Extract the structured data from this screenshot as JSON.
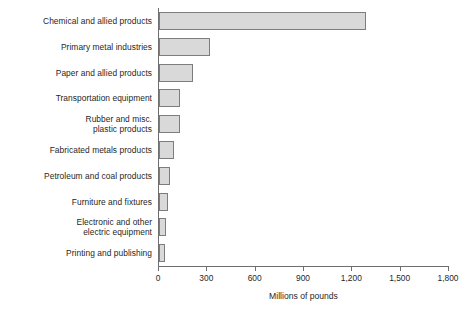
{
  "chart_data": {
    "type": "bar",
    "orientation": "horizontal",
    "title": "",
    "xlabel": "Millions of pounds",
    "ylabel": "",
    "xlim": [
      0,
      1800
    ],
    "xticks": [
      0,
      300,
      600,
      900,
      1200,
      1500,
      1800
    ],
    "xtick_labels": [
      "0",
      "300",
      "600",
      "900",
      "1,200",
      "1,500",
      "1,800"
    ],
    "grid": false,
    "legend": null,
    "bar_fill_color": "#d9d9d9",
    "bar_edge_color": "#7d7d7d",
    "axis_color": "#6e6e6e",
    "categories": [
      "Chemical and allied products",
      "Primary metal industries",
      "Paper and allied products",
      "Transportation equipment",
      "Rubber and misc. plastic products",
      "Fabricated metals products",
      "Petroleum and coal products",
      "Furniture and fixtures",
      "Electronic and other electric equipment",
      "Printing and publishing"
    ],
    "values": [
      1285,
      317,
      211,
      130,
      128,
      93,
      70,
      58,
      45,
      38
    ]
  },
  "rows": [
    {
      "label_lines": [
        "Chemical and allied products"
      ],
      "value": 1285
    },
    {
      "label_lines": [
        "Primary metal industries"
      ],
      "value": 317
    },
    {
      "label_lines": [
        "Paper and allied products"
      ],
      "value": 211
    },
    {
      "label_lines": [
        "Transportation equipment"
      ],
      "value": 130
    },
    {
      "label_lines": [
        "Rubber and misc.",
        "plastic products"
      ],
      "value": 128
    },
    {
      "label_lines": [
        "Fabricated metals products"
      ],
      "value": 93
    },
    {
      "label_lines": [
        "Petroleum and coal products"
      ],
      "value": 70
    },
    {
      "label_lines": [
        "Furniture and fixtures"
      ],
      "value": 58
    },
    {
      "label_lines": [
        "Electronic and other",
        "electric equipment"
      ],
      "value": 45
    },
    {
      "label_lines": [
        "Printing and publishing"
      ],
      "value": 38
    }
  ],
  "axis": {
    "x_title": "Millions of pounds",
    "x_max": 1800,
    "ticks": [
      {
        "value": 0,
        "label": "0"
      },
      {
        "value": 300,
        "label": "300"
      },
      {
        "value": 600,
        "label": "600"
      },
      {
        "value": 900,
        "label": "900"
      },
      {
        "value": 1200,
        "label": "1,200"
      },
      {
        "value": 1500,
        "label": "1,500"
      },
      {
        "value": 1800,
        "label": "1,800"
      }
    ]
  }
}
